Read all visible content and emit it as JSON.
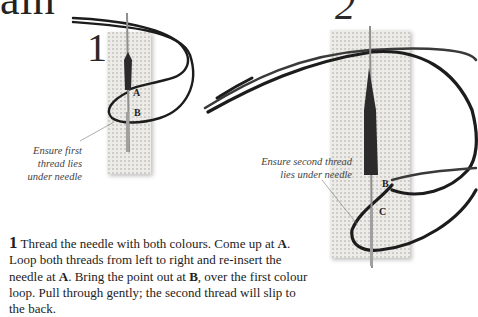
{
  "page": {
    "title_fragment": "ain",
    "steps": [
      {
        "number": "1",
        "caption_lines": [
          "Ensure first",
          "thread lies",
          "under needle"
        ],
        "point_labels": [
          "A",
          "B"
        ]
      },
      {
        "number": "2",
        "caption_lines": [
          "Ensure second thread",
          "lies under needle"
        ],
        "point_labels": [
          "B",
          "C"
        ]
      }
    ],
    "instruction": {
      "step_number": "1",
      "segments": [
        {
          "text": "Thread the needle with both colours. Come up at ",
          "bold": false
        },
        {
          "text": "A",
          "bold": true
        },
        {
          "text": ". Loop both threads from left to right and re-insert the needle at ",
          "bold": false
        },
        {
          "text": "A",
          "bold": true
        },
        {
          "text": ". Bring the point out at ",
          "bold": false
        },
        {
          "text": "B",
          "bold": true
        },
        {
          "text": ", over the first colour loop. Pull through gently; the second thread will slip to the back.",
          "bold": false
        }
      ]
    },
    "colors": {
      "canvas": "#e8e6e2",
      "thread": "#1c1c1c",
      "needle": "#9a9a9a",
      "text": "#222222"
    }
  }
}
